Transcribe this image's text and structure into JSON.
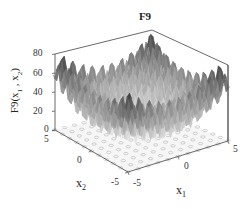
{
  "chart_data": {
    "type": "surface3d",
    "title": "F9",
    "function": "Rastrigin: sum(x_i^2 - 10cos(2*pi*x_i) + 10)",
    "xlabel": "x1",
    "ylabel": "x2",
    "zlabel": "F9(x1 , x2)",
    "xlim": [
      -5,
      5
    ],
    "ylim": [
      -5,
      5
    ],
    "zlim": [
      0,
      80
    ],
    "x_ticks": [
      "-5",
      "0",
      "5"
    ],
    "y_ticks": [
      "-5",
      "0",
      "5"
    ],
    "z_ticks": [
      "0",
      "20",
      "40",
      "60",
      "80"
    ],
    "colormap": "grayscale (high = dark, low = white)",
    "floor_contour": true,
    "grid": false
  },
  "labels": {
    "title": "F9",
    "zlabel_main": "F9(x",
    "zlabel_sub1": "1",
    "zlabel_mid": " , x",
    "zlabel_sub2": "2",
    "zlabel_end": ")",
    "x1_main": "x",
    "x1_sub": "1",
    "x2_main": "x",
    "x2_sub": "2"
  },
  "ticks": {
    "z": [
      "80",
      "60",
      "40",
      "20",
      "0"
    ],
    "x1": [
      "-5",
      "0",
      "5"
    ],
    "x2": [
      "5",
      "0",
      "-5"
    ]
  }
}
